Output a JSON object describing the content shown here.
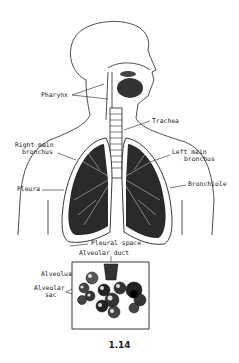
{
  "diagram": {
    "figure_number": "1.14",
    "labels": {
      "pharynx": "Pharynx",
      "trachea": "Trachea",
      "right_main_bronchus_1": "Right main",
      "right_main_bronchus_2": "bronchus",
      "left_main_bronchus_1": "Left main",
      "left_main_bronchus_2": "bronchus",
      "pleura": "Pleura",
      "bronchiole": "Bronchiole",
      "pleural_space": "Pleural space",
      "alveolar_duct": "Alveolar duct",
      "alveolus": "Alveolus",
      "alveolar_sac_1": "Alveolar",
      "alveolar_sac_2": "sac"
    },
    "inset": "Magnified alveolar cluster"
  }
}
